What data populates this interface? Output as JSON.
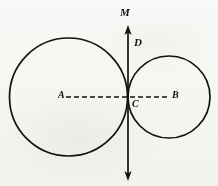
{
  "figure": {
    "background_color": "#fbfbfa",
    "ink_color": "#14120f",
    "labels": {
      "center_left": "A",
      "center_right": "B",
      "tangent_point": "C",
      "vector_top": "M",
      "vector_sub": "D"
    },
    "icon_names": {
      "circle_left": "large-circle-icon",
      "circle_right": "small-circle-icon",
      "dashed_axis": "dashed-horizontal-axis-icon",
      "vertical_arrow": "double-headed-vertical-arrow-icon",
      "arrow_up": "arrowhead-up-icon",
      "arrow_down": "arrowhead-down-icon"
    }
  },
  "chart_data": {
    "type": "diagram",
    "xlabel": "",
    "ylabel": "",
    "xlim": [
      0,
      218
    ],
    "ylim": [
      0,
      186
    ],
    "grid": false,
    "legend": "none",
    "circles": [
      {
        "name": "left-circle",
        "center_label": "A",
        "cx": 68.5,
        "cy": 97,
        "r": 59,
        "stroke": "#14120f",
        "stroke_width": 1.6,
        "fill": "none"
      },
      {
        "name": "right-circle",
        "center_label": "B",
        "cx": 169,
        "cy": 97,
        "r": 41,
        "stroke": "#14120f",
        "stroke_width": 1.6,
        "fill": "none"
      }
    ],
    "points": [
      {
        "label": "A",
        "x": 68.5,
        "y": 97,
        "role": "center-of-left-circle",
        "label_x": 60,
        "label_y": 92
      },
      {
        "label": "C",
        "x": 128,
        "y": 97,
        "role": "tangent-point",
        "label_x": 132,
        "label_y": 99
      },
      {
        "label": "B",
        "x": 169,
        "y": 97,
        "role": "center-of-right-circle",
        "label_x": 172,
        "label_y": 92
      }
    ],
    "segments": [
      {
        "name": "dashed-axis",
        "from_label": "A",
        "to_label": "B",
        "x1": 66,
        "y1": 97,
        "x2": 170,
        "y2": 97,
        "style": "dashed",
        "dash_pattern": "5,3",
        "stroke": "#14120f",
        "stroke_width": 1.3
      },
      {
        "name": "vertical-tangent-line",
        "x1": 128,
        "y1": 26,
        "x2": 128,
        "y2": 180,
        "style": "solid",
        "stroke": "#14120f",
        "stroke_width": 1.6,
        "arrow_start": true,
        "arrow_end": true
      }
    ],
    "annotations": [
      {
        "text": "M",
        "x": 122,
        "y": 22,
        "role": "vector-name"
      },
      {
        "text": "D",
        "x": 134,
        "y": 47,
        "role": "direction-label"
      },
      {
        "text": "A",
        "x": 60,
        "y": 97,
        "role": "point-label"
      },
      {
        "text": "C",
        "x": 133,
        "y": 103,
        "role": "point-label"
      },
      {
        "text": "B",
        "x": 174,
        "y": 97,
        "role": "point-label"
      }
    ]
  }
}
